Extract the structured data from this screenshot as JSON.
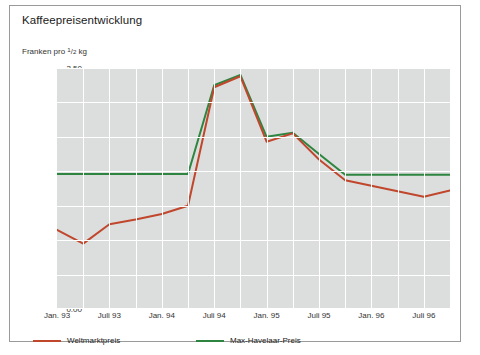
{
  "title": "Kaffeepreisentwicklung",
  "y_axis_label_parts": {
    "prefix": "Franken pro ",
    "numerator": "1",
    "denominator": "2",
    "unit": " kg"
  },
  "y_axis_label": "Franken pro 1/2 kg",
  "colors": {
    "weltmarktpreis": "#c0462c",
    "max_havelaar": "#2d8540",
    "plot_background": "#dcdedd",
    "grid": "#ffffff",
    "frame_border": "#9a9a9a",
    "text": "#1a1a1a"
  },
  "legend": {
    "position": "bottom-left",
    "items": [
      {
        "label": "Weltmarktpreis",
        "color": "#c0462c"
      },
      {
        "label": "Max-Havelaar-Preis",
        "color": "#2d8540"
      }
    ]
  },
  "chart_data": {
    "type": "line",
    "title": "Kaffeepreisentwicklung",
    "xlabel": "",
    "ylabel": "Franken pro 1/2 kg",
    "ylim": [
      0.0,
      3.5
    ],
    "ytick_labels": [
      "0.00",
      "0.50",
      "1.00",
      "1.50",
      "2.00",
      "2.50",
      "3.00",
      "3.50"
    ],
    "ytick_values": [
      0.0,
      0.5,
      1.0,
      1.5,
      2.0,
      2.5,
      3.0,
      3.5
    ],
    "xtick_labels": [
      "Jan. 93",
      "Juli 93",
      "Jan. 94",
      "Juli 94",
      "Jan. 95",
      "Juli 95",
      "Jan. 96",
      "Juli 96"
    ],
    "x": [
      "Jan. 93",
      "Apr. 93",
      "Juli 93",
      "Okt. 93",
      "Jan. 94",
      "Apr. 94",
      "Juli 94",
      "Okt. 94",
      "Jan. 95",
      "Apr. 95",
      "Juli 95",
      "Okt. 95",
      "Jan. 96",
      "Apr. 96",
      "Juli 96",
      "Okt. 96"
    ],
    "grid": true,
    "legend_position": "bottom-left",
    "series": [
      {
        "name": "Weltmarktpreis",
        "color": "#c0462c",
        "values": [
          1.15,
          0.95,
          1.23,
          1.3,
          1.38,
          1.5,
          3.22,
          3.38,
          2.43,
          2.55,
          2.17,
          1.87,
          1.79,
          1.71,
          1.63,
          1.72
        ]
      },
      {
        "name": "Max-Havelaar-Preis",
        "color": "#2d8540",
        "values": [
          1.96,
          1.96,
          1.96,
          1.96,
          1.96,
          1.96,
          3.25,
          3.4,
          2.5,
          2.56,
          2.25,
          1.95,
          1.95,
          1.95,
          1.95,
          1.95
        ]
      }
    ]
  }
}
